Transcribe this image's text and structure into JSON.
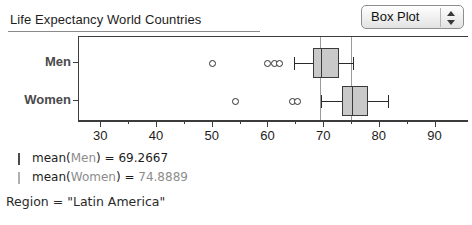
{
  "header": {
    "title": "Life Expectancy World Countries",
    "plot_type_selector": {
      "value": "Box Plot",
      "up_icon": "triangle-up-icon",
      "down_icon": "triangle-down-icon"
    }
  },
  "legend": {
    "men_label": "mean(",
    "men_var": "Men",
    "men_close": ") = ",
    "men_value": "69.2667",
    "women_var": "Women",
    "women_value": "74.8889",
    "region_key": "Region",
    "region_eq": " = ",
    "region_value": "\"Latin America\""
  },
  "chart_data": {
    "type": "box",
    "title": "Life Expectancy World Countries",
    "xlabel": "",
    "ylabel": "",
    "xlim": [
      26,
      96
    ],
    "xticks": [
      30,
      40,
      50,
      60,
      70,
      80,
      90
    ],
    "xtick_labels": [
      "30",
      "40",
      "50",
      "60",
      "70",
      "80",
      "90"
    ],
    "minor_xticks": [
      35,
      45,
      55,
      65,
      75,
      85
    ],
    "grid": false,
    "legend_position": "below-plot",
    "categories": [
      "Men",
      "Women"
    ],
    "reference_lines": [
      {
        "label": "mean(Men)",
        "value": 69.2667,
        "color": "#9a9a9a"
      },
      {
        "label": "mean(Women)",
        "value": 74.8889,
        "color": "#9a9a9a"
      }
    ],
    "series": [
      {
        "name": "Men",
        "whisker_low": 64.5,
        "q1": 68.0,
        "median": 69.4,
        "q3": 72.6,
        "whisker_high": 75.2,
        "mean": 69.2667,
        "outliers": [
          50.0,
          59.8,
          61.0,
          62.0
        ]
      },
      {
        "name": "Women",
        "whisker_low": 69.4,
        "q1": 73.2,
        "median": 75.0,
        "q3": 77.8,
        "whisker_high": 81.5,
        "mean": 74.8889,
        "outliers": [
          54.0,
          64.3,
          65.3
        ]
      }
    ]
  }
}
